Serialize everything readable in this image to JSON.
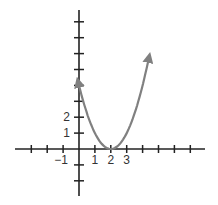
{
  "chart_data": {
    "type": "line",
    "title": "",
    "xlabel": "",
    "ylabel": "",
    "function": "y = (x - 2)^2",
    "series": [
      {
        "name": "parabola",
        "x": [
          -0.05,
          0,
          0.5,
          1,
          1.5,
          2,
          2.5,
          3,
          3.5,
          4,
          4.4
        ],
        "y": [
          4.2,
          4,
          2.25,
          1,
          0.25,
          0,
          0.25,
          1,
          2.25,
          4,
          5.76
        ]
      }
    ],
    "vertex": [
      2,
      0
    ],
    "x_tick_labels": [
      "−1",
      "1",
      "2",
      "3"
    ],
    "x_tick_label_values": [
      -1,
      1,
      2,
      3
    ],
    "y_tick_labels": [
      "1",
      "2"
    ],
    "y_tick_label_values": [
      1,
      2
    ],
    "xlim": [
      -4,
      8
    ],
    "ylim": [
      -3,
      8
    ],
    "x_ticks": [
      -3,
      -2,
      -1,
      1,
      2,
      3,
      4,
      5,
      6,
      7
    ],
    "y_ticks": [
      -2,
      -1,
      1,
      2,
      3,
      4,
      5,
      6,
      7,
      8
    ],
    "grid": false,
    "arrows_on_curve_ends": true,
    "curve_color": "#808080",
    "axis_color": "#222222"
  }
}
